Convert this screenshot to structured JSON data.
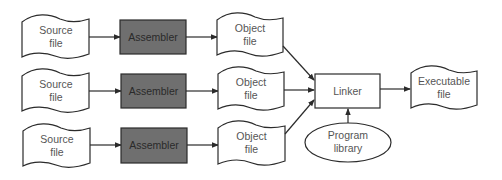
{
  "diagram": {
    "title": "",
    "colors": {
      "assembler_fill": "#6f6f6f",
      "stroke": "#2b2b2b",
      "label_text": "#555555"
    },
    "rows": [
      {
        "source": {
          "line1": "Source",
          "line2": "file"
        },
        "assembler": {
          "label": "Assembler"
        },
        "object": {
          "line1": "Object",
          "line2": "file"
        }
      },
      {
        "source": {
          "line1": "Source",
          "line2": "file"
        },
        "assembler": {
          "label": "Assembler"
        },
        "object": {
          "line1": "Object",
          "line2": "file"
        }
      },
      {
        "source": {
          "line1": "Source",
          "line2": "file"
        },
        "assembler": {
          "label": "Assembler"
        },
        "object": {
          "line1": "Object",
          "line2": "file"
        }
      }
    ],
    "linker": {
      "label": "Linker"
    },
    "library": {
      "line1": "Program",
      "line2": "library"
    },
    "executable": {
      "line1": "Executable",
      "line2": "file"
    },
    "edges": [
      {
        "from": "source-1",
        "to": "assembler-1"
      },
      {
        "from": "assembler-1",
        "to": "object-1"
      },
      {
        "from": "source-2",
        "to": "assembler-2"
      },
      {
        "from": "assembler-2",
        "to": "object-2"
      },
      {
        "from": "source-3",
        "to": "assembler-3"
      },
      {
        "from": "assembler-3",
        "to": "object-3"
      },
      {
        "from": "object-1",
        "to": "linker"
      },
      {
        "from": "object-2",
        "to": "linker"
      },
      {
        "from": "object-3",
        "to": "linker"
      },
      {
        "from": "program-library",
        "to": "linker"
      },
      {
        "from": "linker",
        "to": "executable-file"
      }
    ]
  }
}
